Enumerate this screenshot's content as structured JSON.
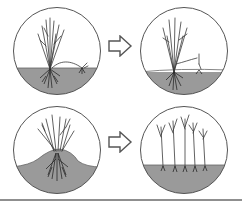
{
  "diagram": {
    "type": "process-illustration",
    "colors": {
      "outline": "#555555",
      "soil": "#9a9a9a",
      "soil_dark": "#7c7c7c",
      "stem": "#3a3a3a",
      "root": "#2a2a2a",
      "rule": "#8f8f8f",
      "background": "#ffffff"
    },
    "rows": [
      {
        "name": "layering",
        "panels": [
          {
            "id": "top-left",
            "stage": "before",
            "ground": "flat",
            "description": "Shrub with one stem bent down and pegged into soil"
          },
          {
            "id": "top-right",
            "stage": "after",
            "ground": "flat",
            "description": "Layered stem rooted and growing upward"
          }
        ],
        "arrow": "right-arrow"
      },
      {
        "name": "mound-layering",
        "panels": [
          {
            "id": "bottom-left",
            "stage": "before",
            "ground": "mound",
            "description": "Cut-back plant with soil mounded over base"
          },
          {
            "id": "bottom-right",
            "stage": "after",
            "ground": "flat",
            "description": "Rooted shoots separated into individual plants"
          }
        ],
        "arrow": "right-arrow"
      }
    ]
  }
}
